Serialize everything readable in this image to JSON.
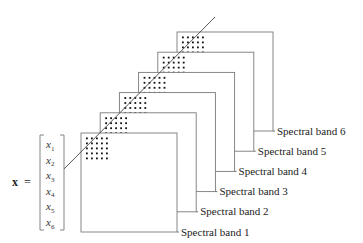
{
  "figure": {
    "vector": {
      "name": "x",
      "equals": "=",
      "entries": [
        {
          "base": "x",
          "sub": "1"
        },
        {
          "base": "x",
          "sub": "2"
        },
        {
          "base": "x",
          "sub": "3"
        },
        {
          "base": "x",
          "sub": "4"
        },
        {
          "base": "x",
          "sub": "5"
        },
        {
          "base": "x",
          "sub": "6"
        }
      ]
    },
    "bands": [
      {
        "label": "Spectral band 1"
      },
      {
        "label": "Spectral band 2"
      },
      {
        "label": "Spectral band 3"
      },
      {
        "label": "Spectral band 4"
      },
      {
        "label": "Spectral band 5"
      },
      {
        "label": "Spectral band 6"
      }
    ],
    "pixel_grid": {
      "rows": 5,
      "cols": 5
    },
    "colors": {
      "stroke": "#7a7a7a",
      "dot": "#111111",
      "line": "#444444"
    }
  }
}
